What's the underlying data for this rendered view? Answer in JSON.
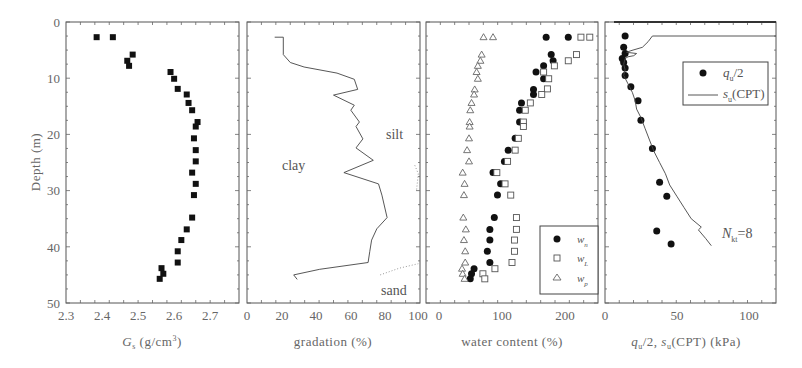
{
  "figure": {
    "y_axis_label": "Depth (m)",
    "y_ticks": [
      "0",
      "10",
      "20",
      "30",
      "40",
      "50"
    ],
    "depth_range": [
      0,
      50
    ]
  },
  "panels": [
    {
      "id": "gs",
      "xlabel_main": "G",
      "xlabel_sub": "s",
      "xlabel_rest": " (g/cm",
      "xlabel_sup": "3",
      "xlabel_end": ")",
      "x_ticks": [
        "2.3",
        "2.4",
        "2.5",
        "2.6",
        "2.7"
      ]
    },
    {
      "id": "gradation",
      "xlabel": "gradation (%)",
      "x_ticks": [
        "0",
        "20",
        "40",
        "60",
        "80",
        "100"
      ],
      "annotations": [
        "clay",
        "silt",
        "sand"
      ]
    },
    {
      "id": "water",
      "xlabel": "water content (%)",
      "x_ticks": [
        "0",
        "100",
        "200"
      ],
      "legend": [
        {
          "symbol": "filled-circle",
          "label": "w",
          "sub": "n"
        },
        {
          "symbol": "open-square",
          "label": "w",
          "sub": "L"
        },
        {
          "symbol": "open-triangle",
          "label": "w",
          "sub": "p"
        }
      ]
    },
    {
      "id": "strength",
      "xlabel": "q_u/2, s_u(CPT) (kPa)",
      "x_ticks": [
        "0",
        "50",
        "100"
      ],
      "legend": [
        {
          "symbol": "filled-circle",
          "label": "q",
          "sub": "u",
          "rest": "/2"
        },
        {
          "symbol": "line",
          "label": "s",
          "sub": "u",
          "rest": "(CPT)"
        }
      ],
      "annotation": {
        "label": "N",
        "sub": "kt",
        "rest": "=8"
      }
    }
  ],
  "chart_data": [
    {
      "type": "scatter",
      "title": "",
      "xlabel": "Gs (g/cm3)",
      "ylabel": "Depth (m)",
      "xlim": [
        2.3,
        2.78
      ],
      "ylim": [
        50,
        0
      ],
      "grid": false,
      "series": [
        {
          "name": "Gs",
          "marker": "filled-square",
          "points": [
            [
              2.385,
              2.7
            ],
            [
              2.43,
              2.7
            ],
            [
              2.485,
              5.8
            ],
            [
              2.47,
              6.9
            ],
            [
              2.475,
              7.8
            ],
            [
              2.59,
              8.9
            ],
            [
              2.6,
              10.1
            ],
            [
              2.61,
              11.9
            ],
            [
              2.635,
              12.9
            ],
            [
              2.64,
              14.4
            ],
            [
              2.65,
              15.7
            ],
            [
              2.665,
              17.8
            ],
            [
              2.66,
              18.6
            ],
            [
              2.655,
              20.7
            ],
            [
              2.66,
              22.8
            ],
            [
              2.66,
              24.8
            ],
            [
              2.65,
              26.8
            ],
            [
              2.66,
              28.8
            ],
            [
              2.655,
              30.8
            ],
            [
              2.65,
              34.8
            ],
            [
              2.635,
              36.9
            ],
            [
              2.62,
              38.8
            ],
            [
              2.61,
              40.8
            ],
            [
              2.61,
              42.8
            ],
            [
              2.565,
              43.8
            ],
            [
              2.57,
              44.8
            ],
            [
              2.56,
              45.7
            ]
          ]
        }
      ]
    },
    {
      "type": "line",
      "title": "",
      "xlabel": "gradation (%)",
      "ylabel": "Depth (m)",
      "xlim": [
        0,
        100
      ],
      "ylim": [
        50,
        0
      ],
      "grid": false,
      "annotations": [
        {
          "text": "clay",
          "x": 25,
          "y": 26
        },
        {
          "text": "silt",
          "x": 85,
          "y": 20
        },
        {
          "text": "sand",
          "x": 87,
          "y": 47
        }
      ],
      "series": [
        {
          "name": "clay/silt boundary",
          "style": "solid",
          "points": [
            [
              16,
              2.7
            ],
            [
              21,
              2.7
            ],
            [
              21,
              5.8
            ],
            [
              25,
              7.2
            ],
            [
              33,
              8.0
            ],
            [
              52,
              9.1
            ],
            [
              62,
              10.2
            ],
            [
              64,
              12.0
            ],
            [
              50,
              13.0
            ],
            [
              62,
              14.8
            ],
            [
              60,
              15.7
            ],
            [
              65,
              17.8
            ],
            [
              63,
              18.6
            ],
            [
              67,
              20.8
            ],
            [
              63,
              22.4
            ],
            [
              73,
              24.6
            ],
            [
              56,
              26.8
            ],
            [
              76,
              28.8
            ],
            [
              78,
              30.8
            ],
            [
              81,
              34.8
            ],
            [
              75,
              36.8
            ],
            [
              72,
              38.8
            ],
            [
              71,
              40.8
            ],
            [
              70,
              42.8
            ],
            [
              42,
              44.0
            ],
            [
              27,
              45.0
            ],
            [
              29,
              45.8
            ]
          ]
        },
        {
          "name": "silt/sand boundary",
          "style": "dotted",
          "points": [
            [
              97,
              25.5
            ],
            [
              99,
              27.0
            ],
            [
              98,
              30.0
            ]
          ]
        },
        {
          "name": "silt/sand boundary (lower)",
          "style": "dotted",
          "points": [
            [
              77,
              45.0
            ],
            [
              88,
              43.8
            ],
            [
              99,
              43.0
            ]
          ]
        }
      ]
    },
    {
      "type": "scatter",
      "title": "",
      "xlabel": "water content (%)",
      "ylabel": "Depth (m)",
      "xlim": [
        -20,
        252
      ],
      "ylim": [
        50,
        0
      ],
      "grid": false,
      "legend_position": "lower right",
      "series": [
        {
          "name": "wn",
          "marker": "filled-circle",
          "points": [
            [
              170,
              2.7
            ],
            [
              205,
              2.7
            ],
            [
              178,
              5.8
            ],
            [
              181,
              6.9
            ],
            [
              166,
              7.8
            ],
            [
              154,
              8.9
            ],
            [
              166,
              10.1
            ],
            [
              150,
              12.0
            ],
            [
              150,
              12.9
            ],
            [
              131,
              14.4
            ],
            [
              128,
              15.7
            ],
            [
              128,
              17.8
            ],
            [
              121,
              20.7
            ],
            [
              110,
              22.8
            ],
            [
              104,
              24.8
            ],
            [
              86,
              26.8
            ],
            [
              98,
              28.8
            ],
            [
              93,
              30.8
            ],
            [
              88,
              34.8
            ],
            [
              81,
              36.9
            ],
            [
              81,
              38.8
            ],
            [
              77,
              40.8
            ],
            [
              81,
              42.8
            ],
            [
              56,
              43.9
            ],
            [
              52,
              44.8
            ],
            [
              50,
              45.7
            ]
          ]
        },
        {
          "name": "wL",
          "marker": "open-square",
          "points": [
            [
              225,
              2.7
            ],
            [
              239,
              2.7
            ],
            [
              218,
              5.8
            ],
            [
              205,
              6.9
            ],
            [
              183,
              7.8
            ],
            [
              166,
              8.9
            ],
            [
              174,
              10.1
            ],
            [
              172,
              11.9
            ],
            [
              163,
              12.9
            ],
            [
              145,
              14.4
            ],
            [
              137,
              15.7
            ],
            [
              134,
              17.8
            ],
            [
              134,
              18.6
            ],
            [
              126,
              20.7
            ],
            [
              121,
              22.8
            ],
            [
              109,
              24.8
            ],
            [
              92,
              26.8
            ],
            [
              105,
              28.8
            ],
            [
              114,
              30.8
            ],
            [
              123,
              34.8
            ],
            [
              123,
              36.9
            ],
            [
              120,
              38.8
            ],
            [
              120,
              40.8
            ],
            [
              116,
              42.8
            ],
            [
              89,
              43.9
            ],
            [
              70,
              44.8
            ],
            [
              73,
              45.7
            ]
          ]
        },
        {
          "name": "wp",
          "marker": "open-triangle",
          "points": [
            [
              71,
              2.7
            ],
            [
              86,
              2.7
            ],
            [
              68,
              5.8
            ],
            [
              66,
              6.9
            ],
            [
              62,
              7.8
            ],
            [
              60,
              8.9
            ],
            [
              62,
              10.1
            ],
            [
              57,
              12.0
            ],
            [
              56,
              12.9
            ],
            [
              52,
              14.4
            ],
            [
              50,
              15.7
            ],
            [
              49,
              17.8
            ],
            [
              49,
              18.6
            ],
            [
              48,
              20.7
            ],
            [
              45,
              22.8
            ],
            [
              48,
              24.8
            ],
            [
              38,
              26.8
            ],
            [
              41,
              28.8
            ],
            [
              40,
              30.8
            ],
            [
              39,
              34.8
            ],
            [
              43,
              36.9
            ],
            [
              40,
              38.8
            ],
            [
              42,
              40.8
            ],
            [
              42,
              42.8
            ],
            [
              37,
              43.9
            ],
            [
              38,
              44.8
            ],
            [
              41,
              45.7
            ]
          ]
        }
      ]
    },
    {
      "type": "scatter",
      "title": "",
      "xlabel": "qu/2, su(CPT) (kPa)",
      "ylabel": "Depth (m)",
      "xlim": [
        0,
        119
      ],
      "ylim": [
        50,
        0
      ],
      "grid": false,
      "legend_position": "upper right",
      "annotations": [
        {
          "text": "Nkt=8",
          "x": 82,
          "y": 37.5
        }
      ],
      "series": [
        {
          "name": "qu/2",
          "marker": "filled-circle",
          "points": [
            [
              14,
              2.5
            ],
            [
              13,
              4.5
            ],
            [
              14,
              5.6
            ],
            [
              12,
              6.5
            ],
            [
              13,
              7.2
            ],
            [
              14,
              8.2
            ],
            [
              14,
              9.5
            ],
            [
              18,
              11.5
            ],
            [
              23,
              14.0
            ],
            [
              25,
              17.5
            ],
            [
              33,
              22.5
            ],
            [
              38,
              28.5
            ],
            [
              43,
              31.0
            ],
            [
              36,
              37.2
            ],
            [
              46,
              39.5
            ]
          ]
        },
        {
          "name": "su(CPT)",
          "marker": "line",
          "points": [
            [
              119,
              2.5
            ],
            [
              33,
              2.5
            ],
            [
              30,
              3.5
            ],
            [
              26,
              4.5
            ],
            [
              18,
              5.1
            ],
            [
              15,
              5.4
            ],
            [
              22,
              5.6
            ],
            [
              20,
              6.0
            ],
            [
              16,
              6.2
            ],
            [
              14,
              6.5
            ],
            [
              13,
              7.5
            ],
            [
              14,
              8.5
            ],
            [
              13,
              9.5
            ],
            [
              16,
              11.0
            ],
            [
              19,
              12.5
            ],
            [
              21,
              14.0
            ],
            [
              22,
              15.5
            ],
            [
              25,
              17.0
            ],
            [
              28,
              19.0
            ],
            [
              31,
              21.0
            ],
            [
              34,
              23.0
            ],
            [
              38,
              25.0
            ],
            [
              42,
              27.0
            ],
            [
              45,
              29.0
            ],
            [
              50,
              31.0
            ],
            [
              55,
              33.0
            ],
            [
              60,
              35.0
            ],
            [
              67,
              36.5
            ],
            [
              65,
              37.0
            ],
            [
              70,
              38.5
            ],
            [
              74,
              39.8
            ]
          ]
        }
      ]
    }
  ]
}
